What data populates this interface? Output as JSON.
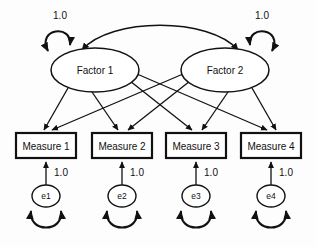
{
  "diagram": {
    "type": "sem-path-diagram",
    "title": "",
    "background_color": "#fdfdfd",
    "stroke_color": "#111111",
    "fill_color": "#ffffff",
    "factors": [
      {
        "id": "factor1",
        "label": "Factor 1",
        "cx": 95,
        "cy": 70,
        "rx": 44,
        "ry": 22
      },
      {
        "id": "factor2",
        "label": "Factor 2",
        "cx": 225,
        "cy": 70,
        "rx": 44,
        "ry": 22
      }
    ],
    "measures": [
      {
        "id": "measure1",
        "label": "Measure 1",
        "x": 16,
        "y": 133,
        "w": 60,
        "h": 25
      },
      {
        "id": "measure2",
        "label": "Measure 2",
        "x": 92,
        "y": 133,
        "w": 60,
        "h": 25
      },
      {
        "id": "measure3",
        "label": "Measure 3",
        "x": 166,
        "y": 133,
        "w": 60,
        "h": 25
      },
      {
        "id": "measure4",
        "label": "Measure 4",
        "x": 241,
        "y": 133,
        "w": 60,
        "h": 25
      }
    ],
    "errors": [
      {
        "id": "e1",
        "label": "e1",
        "cx": 46,
        "cy": 196,
        "rx": 14,
        "ry": 11
      },
      {
        "id": "e2",
        "label": "e2",
        "cx": 122,
        "cy": 196,
        "rx": 14,
        "ry": 11
      },
      {
        "id": "e3",
        "label": "e3",
        "cx": 196,
        "cy": 196,
        "rx": 14,
        "ry": 11
      },
      {
        "id": "e4",
        "label": "e4",
        "cx": 271,
        "cy": 196,
        "rx": 14,
        "ry": 11
      }
    ],
    "variance_labels": [
      {
        "id": "factor1-variance",
        "text": "1.0",
        "x": 60,
        "y": 15
      },
      {
        "id": "factor2-variance",
        "text": "1.0",
        "x": 262,
        "y": 15
      },
      {
        "id": "e1-loading",
        "text": "1.0",
        "x": 61,
        "y": 172
      },
      {
        "id": "e2-loading",
        "text": "1.0",
        "x": 137,
        "y": 172
      },
      {
        "id": "e3-loading",
        "text": "1.0",
        "x": 211,
        "y": 172
      },
      {
        "id": "e4-loading",
        "text": "1.0",
        "x": 286,
        "y": 172
      }
    ],
    "loadings": [
      {
        "from": "factor1",
        "to": "measure1"
      },
      {
        "from": "factor1",
        "to": "measure2"
      },
      {
        "from": "factor1",
        "to": "measure3"
      },
      {
        "from": "factor1",
        "to": "measure4"
      },
      {
        "from": "factor2",
        "to": "measure1"
      },
      {
        "from": "factor2",
        "to": "measure2"
      },
      {
        "from": "factor2",
        "to": "measure3"
      },
      {
        "from": "factor2",
        "to": "measure4"
      }
    ],
    "error_paths": [
      {
        "from": "e1",
        "to": "measure1",
        "value": "1.0"
      },
      {
        "from": "e2",
        "to": "measure2",
        "value": "1.0"
      },
      {
        "from": "e3",
        "to": "measure3",
        "value": "1.0"
      },
      {
        "from": "e4",
        "to": "measure4",
        "value": "1.0"
      }
    ],
    "covariances": [
      {
        "id": "factor-covariance",
        "from": "factor1",
        "to": "factor2",
        "style": "double-headed-arc"
      }
    ],
    "self_loops": [
      {
        "id": "factor1-self-loop",
        "on": "factor1",
        "value": "1.0"
      },
      {
        "id": "factor2-self-loop",
        "on": "factor2",
        "value": "1.0"
      },
      {
        "id": "e1-self-loop",
        "on": "e1",
        "value": ""
      },
      {
        "id": "e2-self-loop",
        "on": "e2",
        "value": ""
      },
      {
        "id": "e3-self-loop",
        "on": "e3",
        "value": ""
      },
      {
        "id": "e4-self-loop",
        "on": "e4",
        "value": ""
      }
    ]
  }
}
